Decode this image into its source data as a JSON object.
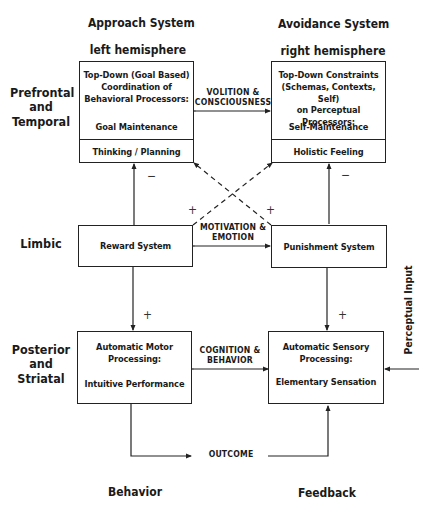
{
  "columns": {
    "left": {
      "title": "Approach System",
      "subtitle": "left hemisphere",
      "footer": "Behavior"
    },
    "right": {
      "title": "Avoidance System",
      "subtitle": "right hemisphere",
      "footer": "Feedback"
    }
  },
  "rows": {
    "top": {
      "label_lines": [
        "Prefrontal",
        "and",
        "Temporal"
      ]
    },
    "middle": {
      "label_lines": [
        "Limbic"
      ]
    },
    "bottom": {
      "label_lines": [
        "Posterior",
        "and",
        "Striatal"
      ]
    }
  },
  "boxes": {
    "top_left": {
      "lines": [
        "Top-Down (Goal Based)",
        "Coordination of",
        "Behavioral Processors:"
      ],
      "main": "Goal Maintenance",
      "sub": "Thinking / Planning"
    },
    "top_right": {
      "lines": [
        "Top-Down Constraints",
        "(Schemas, Contexts, Self)",
        "on Perceptual Processors:"
      ],
      "main": "Self-Maintenance",
      "sub": "Holistic Feeling"
    },
    "mid_left": {
      "main": "Reward System"
    },
    "mid_right": {
      "main": "Punishment System"
    },
    "bot_left": {
      "lines": [
        "Automatic Motor",
        "Processing:"
      ],
      "main": "Intuitive Performance"
    },
    "bot_right": {
      "lines": [
        "Automatic Sensory",
        "Processing:"
      ],
      "main": "Elementary Sensation"
    }
  },
  "connectors": {
    "top": [
      "VOLITION &",
      "CONSCIOUSNESS"
    ],
    "middle": [
      "MOTIVATION &",
      "EMOTION"
    ],
    "bottom": [
      "COGNITION &",
      "BEHAVIOR"
    ],
    "outcome": "OUTCOME",
    "perceptual_input": "Perceptual Input"
  },
  "signs": {
    "left_upper": "−",
    "right_upper": "−",
    "cross_left": "+",
    "cross_right": "+",
    "left_lower": "+",
    "right_lower": "+"
  }
}
